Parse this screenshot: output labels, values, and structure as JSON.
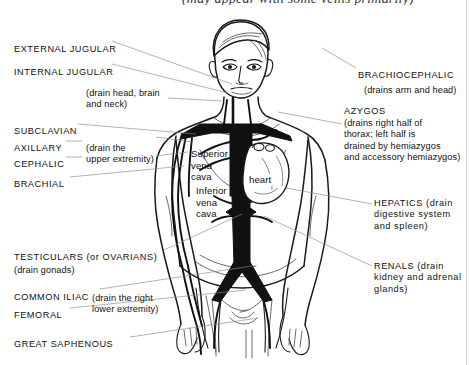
{
  "page": {
    "top_caption": "(may appear with some veins primarily)",
    "background_color": "#ffffff",
    "ink_color": "#111111",
    "leader_color": "#8a8a8a",
    "vein_fill_color": "#111111"
  },
  "figure": {
    "name": "anterior-male-torso-with-systemic-veins"
  },
  "labels_left": [
    {
      "id": "external-jugular",
      "text": "EXTERNAL JUGULAR",
      "x": 14,
      "y": 44,
      "style": "caps"
    },
    {
      "id": "internal-jugular",
      "text": "INTERNAL JUGULAR",
      "x": 14,
      "y": 67,
      "style": "caps"
    },
    {
      "id": "jugular-note",
      "text": "(drain head, brain\nand neck)",
      "x": 86,
      "y": 88,
      "style": "note"
    },
    {
      "id": "subclavian",
      "text": "SUBCLAVIAN",
      "x": 14,
      "y": 126,
      "style": "caps"
    },
    {
      "id": "axillary",
      "text": "AXILLARY",
      "x": 14,
      "y": 143,
      "style": "caps"
    },
    {
      "id": "upper-extremity-note",
      "text": "(drain the\nupper extremity)",
      "x": 86,
      "y": 143,
      "style": "note"
    },
    {
      "id": "cephalic",
      "text": "CEPHALIC",
      "x": 14,
      "y": 159,
      "style": "caps"
    },
    {
      "id": "brachial",
      "text": "BRACHIAL",
      "x": 14,
      "y": 179,
      "style": "caps"
    },
    {
      "id": "testiculars-ovarians",
      "text": "TESTICULARS (or OVARIANS)",
      "x": 14,
      "y": 252,
      "style": "caps"
    },
    {
      "id": "gonads-note",
      "text": "(drain gonads)",
      "x": 14,
      "y": 265,
      "style": "note"
    },
    {
      "id": "common-iliac",
      "text": "COMMON ILIAC",
      "x": 14,
      "y": 292,
      "style": "caps"
    },
    {
      "id": "lower-extremity-note",
      "text": "(drain the right\nlower extremity)",
      "x": 92,
      "y": 293,
      "style": "note"
    },
    {
      "id": "femoral",
      "text": "FEMORAL",
      "x": 14,
      "y": 310,
      "style": "caps"
    },
    {
      "id": "great-saphenous",
      "text": "GREAT SAPHENOUS",
      "x": 14,
      "y": 339,
      "style": "caps"
    }
  ],
  "labels_right": [
    {
      "id": "brachiocephalic",
      "text": "BRACHIOCEPHALIC",
      "x": 358,
      "y": 70,
      "style": "caps"
    },
    {
      "id": "brachiocephalic-note",
      "text": "(drains arm and head)",
      "x": 364,
      "y": 85,
      "style": "note"
    },
    {
      "id": "azygos",
      "text": "AZYGOS",
      "x": 344,
      "y": 106,
      "style": "caps"
    },
    {
      "id": "azygos-note",
      "text": "(drains right half of\nthorax; left half is\ndrained by hemiazygos\nand accessory hemiazygos)",
      "x": 344,
      "y": 118,
      "style": "note"
    },
    {
      "id": "hepatics",
      "text": "HEPATICS (drain\ndigestive system\nand spleen)",
      "x": 374,
      "y": 198,
      "style": "caps"
    },
    {
      "id": "renals",
      "text": "RENALS (drain\nkidney and adrenal\nglands)",
      "x": 374,
      "y": 261,
      "style": "caps"
    }
  ],
  "labels_inner": [
    {
      "id": "superior-vena-cava",
      "text": "Superior\nvena\ncava",
      "x": 191,
      "y": 148
    },
    {
      "id": "inferior-vena-cava",
      "text": "Inferior\nvena\ncava",
      "x": 196,
      "y": 185
    },
    {
      "id": "heart",
      "text": "heart",
      "x": 243,
      "y": 175
    }
  ],
  "leader_lines": [
    {
      "id": "leader-external-jugular",
      "from": [
        112,
        41
      ],
      "to": [
        232,
        84
      ]
    },
    {
      "id": "leader-internal-jugular",
      "from": [
        112,
        64
      ],
      "to": [
        228,
        92
      ]
    },
    {
      "id": "leader-jugular-note",
      "from": [
        168,
        98
      ],
      "to": [
        222,
        100
      ]
    },
    {
      "id": "leader-subclavian",
      "from": [
        78,
        124
      ],
      "to": [
        196,
        134
      ]
    },
    {
      "id": "leader-axillary",
      "from": [
        66,
        141
      ],
      "to": [
        82,
        141
      ]
    },
    {
      "id": "leader-cephalic",
      "from": [
        66,
        157
      ],
      "to": [
        82,
        157
      ]
    },
    {
      "id": "leader-axillary-arm",
      "from": [
        156,
        137
      ],
      "to": [
        190,
        142
      ]
    },
    {
      "id": "leader-cephalic-arm",
      "from": [
        156,
        156
      ],
      "to": [
        186,
        152
      ]
    },
    {
      "id": "leader-brachial",
      "from": [
        70,
        177
      ],
      "to": [
        182,
        166
      ]
    },
    {
      "id": "leader-testiculars",
      "from": [
        164,
        250
      ],
      "to": [
        240,
        214
      ]
    },
    {
      "id": "leader-common-iliac",
      "from": [
        100,
        289
      ],
      "to": [
        250,
        266
      ]
    },
    {
      "id": "leader-femoral",
      "from": [
        70,
        308
      ],
      "to": [
        244,
        290
      ]
    },
    {
      "id": "leader-great-saphenous",
      "from": [
        130,
        337
      ],
      "to": [
        258,
        318
      ]
    },
    {
      "id": "leader-brachiocephalic",
      "from": [
        356,
        68
      ],
      "to": [
        322,
        48
      ]
    },
    {
      "id": "leader-azygos",
      "from": [
        342,
        124
      ],
      "to": [
        276,
        112
      ]
    },
    {
      "id": "leader-hepatics",
      "from": [
        372,
        204
      ],
      "to": [
        252,
        182
      ]
    },
    {
      "id": "leader-renals",
      "from": [
        372,
        266
      ],
      "to": [
        262,
        214
      ]
    }
  ]
}
